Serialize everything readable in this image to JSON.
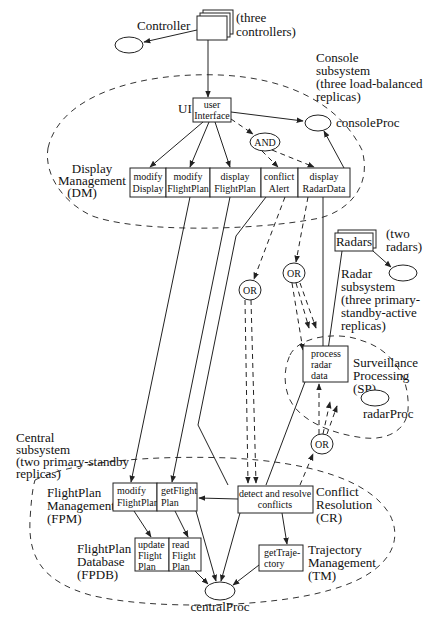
{
  "diagram": {
    "controller": {
      "label": "Controller",
      "note_line1": "(three",
      "note_line2": "controllers)"
    },
    "console_subsystem": {
      "line1": "Console",
      "line2": "subsystem",
      "line3": "(three load-balanced",
      "line4": "replicas)"
    },
    "ui": {
      "label": "UI",
      "box_line1": "user",
      "box_line2": "Interface"
    },
    "console_proc": {
      "label": "consoleProc"
    },
    "and_node": {
      "label": "AND"
    },
    "display_management": {
      "line1": "Display",
      "line2": "Management",
      "line3": "(DM)",
      "cells": [
        {
          "line1": "modify",
          "line2": "Display"
        },
        {
          "line1": "modify",
          "line2": "FlightPlan"
        },
        {
          "line1": "display",
          "line2": "FlightPlan"
        },
        {
          "line1": "conflict",
          "line2": "Alert"
        },
        {
          "line1": "display",
          "line2": "RadarData"
        }
      ]
    },
    "radars": {
      "label": "Radars",
      "note_line1": "(two",
      "note_line2": "radars)"
    },
    "radar_subsystem": {
      "line1": "Radar",
      "line2": "subsystem",
      "line3": "(three primary-",
      "line4": "standby-active",
      "line5": "replicas)"
    },
    "or_nodes": [
      {
        "label": "OR"
      },
      {
        "label": "OR"
      },
      {
        "label": "OR"
      }
    ],
    "surveillance": {
      "box_line1": "process",
      "box_line2": "radar",
      "box_line3": "data",
      "line1": "Surveillance",
      "line2": "Processing",
      "line3": "(SP)",
      "proc_label": "radarProc"
    },
    "central_subsystem": {
      "line1": "Central",
      "line2": "subsystem",
      "line3": "(two primary-standby",
      "line4": "replicas)"
    },
    "fpm": {
      "line1": "FlightPlan",
      "line2": "Management",
      "line3": "(FPM)",
      "cells": [
        {
          "line1": "modify",
          "line2": "FlightPlan"
        },
        {
          "line1": "getFlight",
          "line2": "Plan"
        }
      ]
    },
    "fpdb": {
      "line1": "FlightPlan",
      "line2": "Database",
      "line3": "(FPDB)",
      "cells": [
        {
          "line1": "update",
          "line2": "Flight",
          "line3": "Plan"
        },
        {
          "line1": "read",
          "line2": "Flight",
          "line3": "Plan"
        }
      ]
    },
    "cr": {
      "box_line1": "detect and resolve",
      "box_line2": "conflicts",
      "line1": "Conflict",
      "line2": "Resolution",
      "line3": "(CR)"
    },
    "tm": {
      "box_line1": "getTraje-",
      "box_line2": "ctory",
      "line1": "Trajectory",
      "line2": "Management",
      "line3": "(TM)"
    },
    "central_proc": {
      "label": "centralProc"
    }
  }
}
